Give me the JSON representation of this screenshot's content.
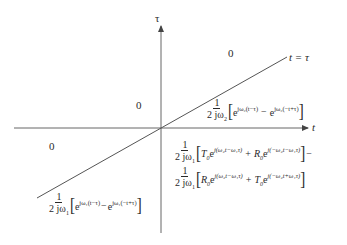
{
  "axes": {
    "horizontal_label": "t",
    "vertical_label": "τ",
    "diagonal_label": "t = τ",
    "color": "#555555"
  },
  "regions": {
    "top_right_zero": "0",
    "top_left_zero": "0",
    "bottom_left_zero": "0"
  },
  "formulas": {
    "upper_wedge": {
      "num": "1",
      "den": "2 jω",
      "den_sub": "2",
      "t1": "e",
      "t1_exp": "jω₂(t−τ)",
      "op": "−",
      "t2": "e",
      "t2_exp": "jω₂(−t+τ)"
    },
    "lower_right_line1": {
      "num": "1",
      "den": "2 jω",
      "den_sub": "1",
      "c1": "T",
      "c1_sub": "0",
      "t1": "e",
      "t1_exp": "j(ω₂t−ω₁τ)",
      "op": "+",
      "c2": "R",
      "c2_sub": "0",
      "t2": "e",
      "t2_exp": "j(−ω₂t−ω₁τ)",
      "trailing": "−"
    },
    "lower_right_line2": {
      "num": "1",
      "den": "2 jω",
      "den_sub": "1",
      "c1": "R",
      "c1_sub": "0",
      "t1": "e",
      "t1_exp": "j(ω₂t−ω₁τ)",
      "op": "+",
      "c2": "T",
      "c2_sub": "0",
      "t2": "e",
      "t2_exp": "j(−ω₂t+ω₁τ)"
    },
    "lower_left": {
      "num": "1",
      "den": "2 jω",
      "den_sub": "1",
      "t1": "e",
      "t1_exp": "jω₁(t−τ)",
      "op": "−",
      "t2": "e",
      "t2_exp": "jω₁(−t+τ)"
    }
  }
}
